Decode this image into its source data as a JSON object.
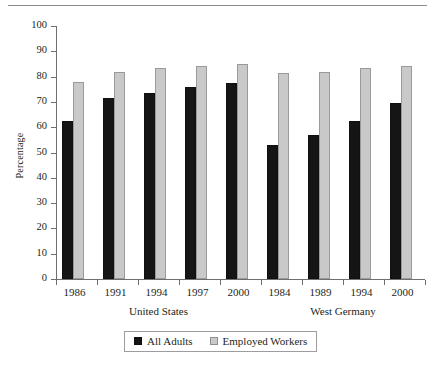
{
  "chart_data": {
    "type": "bar",
    "title": "",
    "subtitle": "",
    "xlabel": "",
    "ylabel": "Percentage",
    "ylim": [
      0,
      100
    ],
    "ytick_step": 10,
    "ytick_labels": [
      "0",
      "10",
      "20",
      "30",
      "40",
      "50",
      "60",
      "70",
      "80",
      "90",
      "100"
    ],
    "grid": false,
    "legend_position": "bottom-center",
    "categories": [
      "1986",
      "1991",
      "1994",
      "1997",
      "2000",
      "1984",
      "1989",
      "1994",
      "2000"
    ],
    "groups": [
      {
        "name": "United States",
        "categories": [
          "1986",
          "1991",
          "1994",
          "1997",
          "2000"
        ]
      },
      {
        "name": "West Germany",
        "categories": [
          "1984",
          "1989",
          "1994",
          "2000"
        ]
      }
    ],
    "series": [
      {
        "name": "All Adults",
        "color": "#151515",
        "values": [
          62.5,
          71.5,
          73.5,
          76.0,
          77.5,
          53.0,
          57.0,
          62.5,
          69.5
        ]
      },
      {
        "name": "Employed Workers",
        "color": "#c9c9c9",
        "values": [
          78.0,
          82.0,
          83.5,
          84.2,
          85.0,
          81.5,
          82.0,
          83.5,
          84.2
        ]
      }
    ]
  },
  "legend": {
    "items": [
      {
        "label": "All Adults",
        "swatch": "adults"
      },
      {
        "label": "Employed Workers",
        "swatch": "workers"
      }
    ]
  },
  "axes": {
    "y_title": "Percentage"
  }
}
